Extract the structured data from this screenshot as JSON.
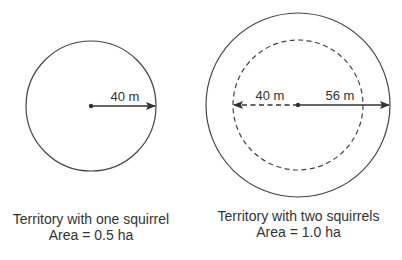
{
  "colors": {
    "stroke": "#444444",
    "text": "#333333",
    "background": "#ffffff"
  },
  "diagram_one": {
    "radius_label": "40 m",
    "caption_title": "Territory with one squirrel",
    "caption_area": "Area = 0.5 ha"
  },
  "diagram_two": {
    "inner_radius_label": "40 m",
    "outer_radius_label": "56 m",
    "caption_title": "Territory with two squirrels",
    "caption_area": "Area = 1.0 ha"
  }
}
